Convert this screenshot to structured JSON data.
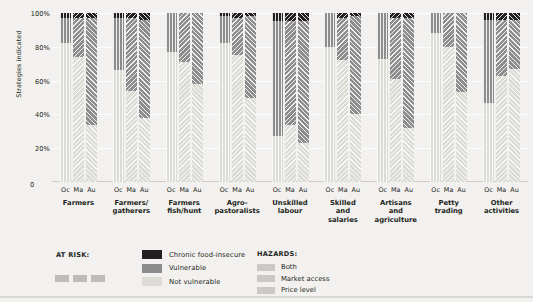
{
  "chart_data": {
    "type": "bar",
    "subtype": "stacked-percent-grouped",
    "title": "",
    "xlabel": "",
    "ylabel": "Strategies indicated",
    "ylim": [
      0,
      100
    ],
    "ytick_labels": [
      "100%",
      "80%",
      "60%",
      "40%",
      "20%",
      "0"
    ],
    "ytick_values": [
      100,
      80,
      60,
      40,
      20,
      0
    ],
    "grid": true,
    "legend_position": "bottom",
    "series_order": [
      "Chronic food-insecure",
      "Vulnerable",
      "Not vulnerable"
    ],
    "hazard_order": [
      "Both",
      "Market access",
      "Price level"
    ],
    "sub_categories": [
      "Oc",
      "Ma",
      "Au"
    ],
    "categories": [
      "Farmers",
      "Farmers/ gatherers",
      "Farmers fish/hunt",
      "Agro- pastoralists",
      "Unskilled labour",
      "Skilled and salaries",
      "Artisans and agriculture",
      "Petty trading",
      "Other activities"
    ],
    "bars": [
      {
        "group": "Farmers",
        "sub": "Oc",
        "hazard": "Both",
        "chronic": 3,
        "vulnerable": 15,
        "not_vulnerable": 82
      },
      {
        "group": "Farmers",
        "sub": "Ma",
        "hazard": "Market access",
        "chronic": 3,
        "vulnerable": 23,
        "not_vulnerable": 74
      },
      {
        "group": "Farmers",
        "sub": "Au",
        "hazard": "Price level",
        "chronic": 3,
        "vulnerable": 63,
        "not_vulnerable": 34
      },
      {
        "group": "Farmers/ gatherers",
        "sub": "Oc",
        "hazard": "Both",
        "chronic": 3,
        "vulnerable": 31,
        "not_vulnerable": 66
      },
      {
        "group": "Farmers/ gatherers",
        "sub": "Ma",
        "hazard": "Market access",
        "chronic": 3,
        "vulnerable": 43,
        "not_vulnerable": 54
      },
      {
        "group": "Farmers/ gatherers",
        "sub": "Au",
        "hazard": "Price level",
        "chronic": 4,
        "vulnerable": 58,
        "not_vulnerable": 38
      },
      {
        "group": "Farmers fish/hunt",
        "sub": "Oc",
        "hazard": "Both",
        "chronic": 0,
        "vulnerable": 23,
        "not_vulnerable": 77
      },
      {
        "group": "Farmers fish/hunt",
        "sub": "Ma",
        "hazard": "Market access",
        "chronic": 0,
        "vulnerable": 29,
        "not_vulnerable": 71
      },
      {
        "group": "Farmers fish/hunt",
        "sub": "Au",
        "hazard": "Price level",
        "chronic": 0,
        "vulnerable": 42,
        "not_vulnerable": 58
      },
      {
        "group": "Agro- pastoralists",
        "sub": "Oc",
        "hazard": "Both",
        "chronic": 2,
        "vulnerable": 16,
        "not_vulnerable": 82
      },
      {
        "group": "Agro- pastoralists",
        "sub": "Ma",
        "hazard": "Market access",
        "chronic": 3,
        "vulnerable": 22,
        "not_vulnerable": 75
      },
      {
        "group": "Agro- pastoralists",
        "sub": "Au",
        "hazard": "Price level",
        "chronic": 2,
        "vulnerable": 48,
        "not_vulnerable": 50
      },
      {
        "group": "Unskilled labour",
        "sub": "Oc",
        "hazard": "Both",
        "chronic": 5,
        "vulnerable": 68,
        "not_vulnerable": 27
      },
      {
        "group": "Unskilled labour",
        "sub": "Ma",
        "hazard": "Market access",
        "chronic": 5,
        "vulnerable": 61,
        "not_vulnerable": 34
      },
      {
        "group": "Unskilled labour",
        "sub": "Au",
        "hazard": "Price level",
        "chronic": 5,
        "vulnerable": 72,
        "not_vulnerable": 23
      },
      {
        "group": "Skilled and salaries",
        "sub": "Oc",
        "hazard": "Both",
        "chronic": 0,
        "vulnerable": 20,
        "not_vulnerable": 80
      },
      {
        "group": "Skilled and salaries",
        "sub": "Ma",
        "hazard": "Market access",
        "chronic": 3,
        "vulnerable": 25,
        "not_vulnerable": 72
      },
      {
        "group": "Skilled and salaries",
        "sub": "Au",
        "hazard": "Price level",
        "chronic": 2,
        "vulnerable": 58,
        "not_vulnerable": 40
      },
      {
        "group": "Artisans and agriculture",
        "sub": "Oc",
        "hazard": "Both",
        "chronic": 0,
        "vulnerable": 27,
        "not_vulnerable": 73
      },
      {
        "group": "Artisans and agriculture",
        "sub": "Ma",
        "hazard": "Market access",
        "chronic": 3,
        "vulnerable": 36,
        "not_vulnerable": 61
      },
      {
        "group": "Artisans and agriculture",
        "sub": "Au",
        "hazard": "Price level",
        "chronic": 3,
        "vulnerable": 65,
        "not_vulnerable": 32
      },
      {
        "group": "Petty trading",
        "sub": "Oc",
        "hazard": "Both",
        "chronic": 0,
        "vulnerable": 12,
        "not_vulnerable": 88
      },
      {
        "group": "Petty trading",
        "sub": "Ma",
        "hazard": "Market access",
        "chronic": 0,
        "vulnerable": 20,
        "not_vulnerable": 80
      },
      {
        "group": "Petty trading",
        "sub": "Au",
        "hazard": "Price level",
        "chronic": 0,
        "vulnerable": 47,
        "not_vulnerable": 53
      },
      {
        "group": "Other activities",
        "sub": "Oc",
        "hazard": "Both",
        "chronic": 4,
        "vulnerable": 49,
        "not_vulnerable": 47
      },
      {
        "group": "Other activities",
        "sub": "Ma",
        "hazard": "Market access",
        "chronic": 4,
        "vulnerable": 33,
        "not_vulnerable": 63
      },
      {
        "group": "Other activities",
        "sub": "Au",
        "hazard": "Price level",
        "chronic": 4,
        "vulnerable": 29,
        "not_vulnerable": 67
      }
    ]
  },
  "legend": {
    "at_risk_title": "AT RISK:",
    "hazards_title": "HAZARDS:",
    "risk_keys": [
      {
        "label": "Chronic food-insecure",
        "color": "#231f20"
      },
      {
        "label": "Vulnerable",
        "color": "#8d8d8d"
      },
      {
        "label": "Not vulnerable",
        "color": "#dddbd6"
      }
    ],
    "hazard_keys": [
      {
        "label": "Both",
        "pattern": "vertical-lines"
      },
      {
        "label": "Market access",
        "pattern": "backslash-hatch"
      },
      {
        "label": "Price level",
        "pattern": "forwardslash-hatch"
      }
    ]
  },
  "colors": {
    "background": "#f2f1ef",
    "chronic": "#231f20",
    "vulnerable": "#8d8d8d",
    "not_vulnerable": "#dddbd6",
    "gridline": "#ffffff",
    "text": "#231f20"
  }
}
